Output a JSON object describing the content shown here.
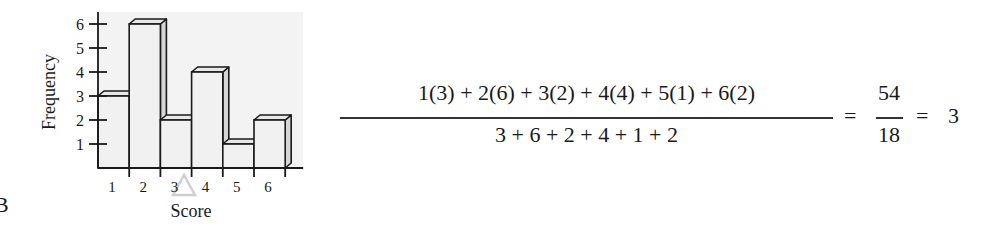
{
  "figure_label": "B",
  "chart_data": {
    "type": "bar",
    "style": "3d-histogram",
    "title": "",
    "xlabel": "Score",
    "ylabel": "Frequency",
    "categories": [
      "1",
      "2",
      "3",
      "4",
      "5",
      "6"
    ],
    "values": [
      3,
      6,
      2,
      4,
      1,
      2
    ],
    "yticks": [
      "1",
      "2",
      "3",
      "4",
      "5",
      "6"
    ],
    "ylim": [
      0,
      6
    ],
    "grid": false,
    "legend": null,
    "colors": {
      "bar_face": "#f1f1f1",
      "bar_side": "#d6d6d6",
      "bar_top": "#e8e8e8",
      "plot_bg": "#f3f3f3",
      "stroke": "#1a1a1a"
    }
  },
  "formula": {
    "numerator": "1(3) + 2(6) + 3(2) + 4(4) + 5(1) + 6(2)",
    "denominator": "3 + 6 + 2 + 4 + 1 + 2",
    "equals_1": "=",
    "result_numerator": "54",
    "result_denominator": "18",
    "equals_2": "=",
    "result": "3"
  }
}
